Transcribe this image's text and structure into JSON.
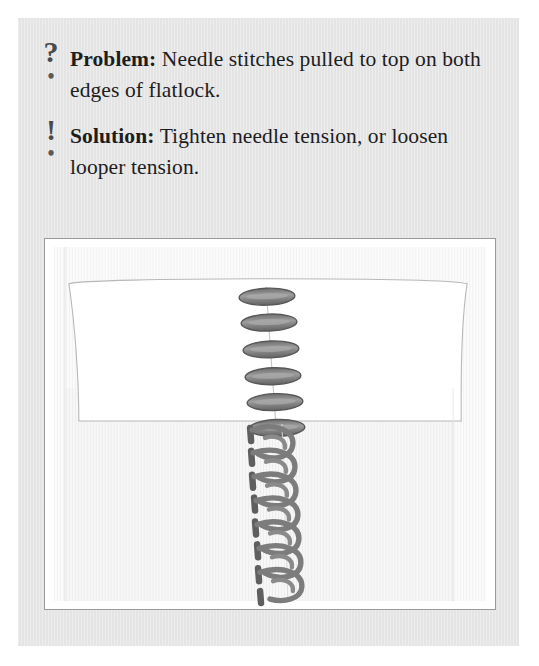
{
  "card": {
    "background_color": "#e6e6e6"
  },
  "tips": [
    {
      "icon": "question-mark-icon",
      "glyph": "?",
      "dot": "•",
      "lead": "Problem:",
      "body": " Needle stitches pulled to top on both edges of flatlock."
    },
    {
      "icon": "exclamation-mark-icon",
      "glyph": "!",
      "dot": "•",
      "lead": "Solution:",
      "body": " Tighten needle tension, or loosen looper tension."
    }
  ],
  "illustration": {
    "name": "flatlock-seam-diagram",
    "description": "Flatlock seam diagram showing an upper folded fabric panel with needle-thread ovals pulled to the top along the seam line, and a lower fabric panel showing looper loops of the flatlock stitch.",
    "colors": {
      "frame_border": "#9a9a9a",
      "upper_fabric": "#ffffff",
      "lower_fabric": "#f6f6f6",
      "fabric_outline": "#b4b4b4",
      "needle_thread": "#6b6b6b",
      "needle_thread_highlight": "#9d9d9d",
      "looper_thread": "#7a7a7a",
      "ladder_thread": "#5f5f5f",
      "seam_line": "#c6c6c6"
    },
    "needle_stitch_count": 6,
    "looper_loop_count": 7,
    "seam_x_ratio": 0.51
  }
}
